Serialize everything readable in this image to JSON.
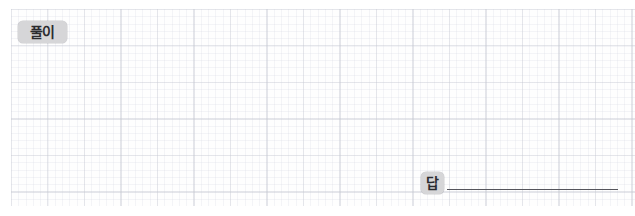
{
  "worksheet": {
    "type": "math-worksheet-answer-area",
    "width": 635,
    "height": 216,
    "background_color": "#ffffff"
  },
  "grid": {
    "name": "graph-paper-grid",
    "minor_cell_px": 7,
    "major_cell_px": 36,
    "minor_line_color": "#a5aabe",
    "major_line_color": "#969baa",
    "fill_color": "#fdfdfe",
    "left": 11,
    "top": 9,
    "width": 624,
    "height": 197
  },
  "solution_section": {
    "badge_label": "풀이",
    "badge_background": "#d6d6d8",
    "badge_text_color": "#2b2b2f",
    "work_area_content": ""
  },
  "answer_section": {
    "badge_label": "답",
    "badge_background": "#d6d6d8",
    "badge_text_color": "#2b2b2f",
    "answer_value": "",
    "answer_line_color": "#55555c",
    "answer_line_width": 171
  }
}
